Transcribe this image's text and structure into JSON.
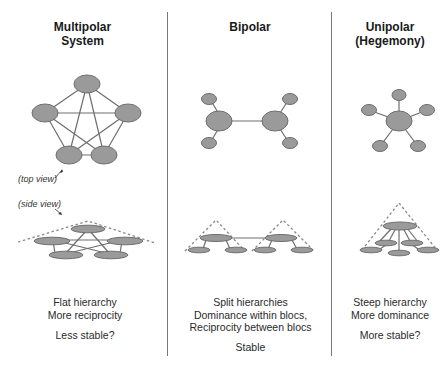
{
  "columns": [
    {
      "id": "multipolar",
      "title_line1": "Multipolar",
      "title_line2": "System",
      "desc_line1": "Flat hierarchy",
      "desc_line2": "More reciprocity",
      "verdict": "Less stable?"
    },
    {
      "id": "bipolar",
      "title_line1": "Bipolar",
      "desc_line1": "Split hierarchies",
      "desc_line2": "Dominance within blocs,",
      "desc_line3": "Reciprocity between blocs",
      "verdict": "Stable"
    },
    {
      "id": "unipolar",
      "title_line1": "Unipolar",
      "title_line2": "(Hegemony)",
      "desc_line1": "Steep hierarchy",
      "desc_line2": "More dominance",
      "verdict": "More stable?"
    }
  ],
  "annotations": {
    "top_view": "(top view)",
    "side_view": "(side view)"
  },
  "colors": {
    "node_fill": "#9a9a9a",
    "node_stroke": "#6e6e6e",
    "edge": "#6e6e6e",
    "dashed": "#888888",
    "divider": "#777777"
  }
}
